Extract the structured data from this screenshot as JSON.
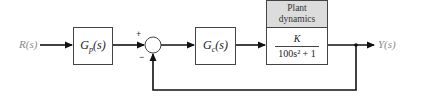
{
  "diagram": {
    "type": "block-diagram",
    "input_signal": "R(s)",
    "output_signal": "Y(s)",
    "prefilter": {
      "name": "G",
      "subscript": "p",
      "arg": "(s)"
    },
    "controller": {
      "name": "G",
      "subscript": "c",
      "arg": "(s)"
    },
    "summing_junction": {
      "plus_sign": "+",
      "minus_sign": "−"
    },
    "plant": {
      "header_line1": "Plant",
      "header_line2": "dynamics",
      "numerator": "K",
      "denominator": "100s² + 1"
    },
    "feedback": "unity negative feedback from Y(s) to summing junction",
    "colors": {
      "line": "#111111",
      "plant_header_bg": "#dcdcdc",
      "signal_text": "#8a8a8a"
    }
  }
}
